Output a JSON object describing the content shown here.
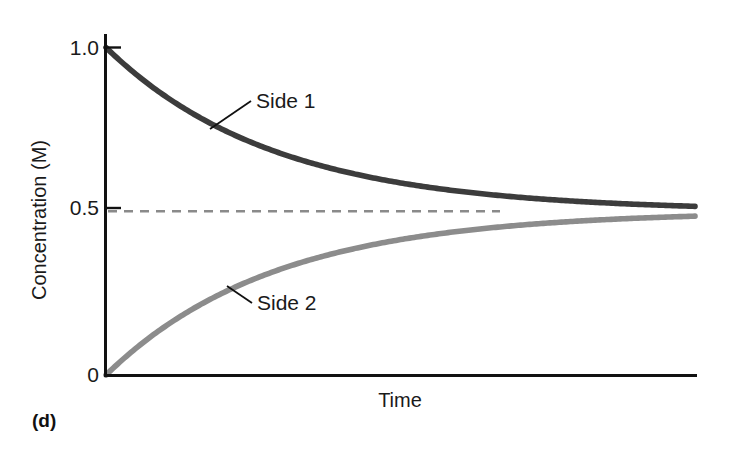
{
  "figure": {
    "panel_label": "(d)",
    "background_color": "#ffffff"
  },
  "chart_data": {
    "type": "line",
    "title": "",
    "subtitle": "",
    "xlabel": "Time",
    "ylabel": "Concentration (M)",
    "xlim": [
      0,
      1
    ],
    "ylim": [
      0,
      1
    ],
    "x_tick_labels": [],
    "y_tick_labels": [
      "0",
      "0.5",
      "1.0"
    ],
    "y_ticks": [
      0,
      0.5,
      1.0
    ],
    "grid": false,
    "legend_position": "inline-annotations",
    "equilibrium_value": 0.5,
    "equilibrium_line": {
      "label": "0.5",
      "style": "dashed",
      "color": "#8a8a8a",
      "value": 0.5
    },
    "series": [
      {
        "name": "Side 1",
        "color": "#3c3c3c",
        "start_value": 1.0,
        "end_value": 0.5,
        "shape": "exponential-decay",
        "x": [
          0,
          0.05,
          0.1,
          0.15,
          0.2,
          0.25,
          0.3,
          0.35,
          0.4,
          0.45,
          0.5,
          0.55,
          0.6,
          0.65,
          0.7,
          0.75,
          0.8,
          0.85,
          0.9,
          0.95,
          1.0
        ],
        "values": [
          1.0,
          0.938,
          0.884,
          0.835,
          0.793,
          0.755,
          0.722,
          0.692,
          0.666,
          0.643,
          0.623,
          0.605,
          0.589,
          0.575,
          0.563,
          0.552,
          0.543,
          0.534,
          0.527,
          0.521,
          0.515
        ]
      },
      {
        "name": "Side 2",
        "color": "#8c8c8c",
        "start_value": 0.0,
        "end_value": 0.5,
        "shape": "exponential-rise",
        "x": [
          0,
          0.05,
          0.1,
          0.15,
          0.2,
          0.25,
          0.3,
          0.35,
          0.4,
          0.45,
          0.5,
          0.55,
          0.6,
          0.65,
          0.7,
          0.75,
          0.8,
          0.85,
          0.9,
          0.95,
          1.0
        ],
        "values": [
          0.0,
          0.062,
          0.116,
          0.165,
          0.207,
          0.245,
          0.278,
          0.308,
          0.334,
          0.357,
          0.377,
          0.395,
          0.411,
          0.425,
          0.437,
          0.448,
          0.457,
          0.466,
          0.473,
          0.479,
          0.485
        ]
      }
    ],
    "annotations": [
      {
        "text": "Side 1",
        "series": "Side 1"
      },
      {
        "text": "Side 2",
        "series": "Side 2"
      }
    ]
  }
}
